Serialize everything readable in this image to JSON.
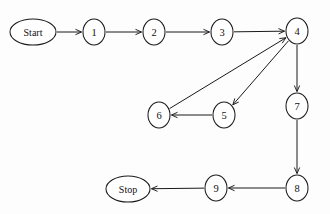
{
  "diagram": {
    "type": "flowchart",
    "title": "",
    "background_color": "#fdfdfd",
    "stroke_color": "#1a1a1a",
    "node_fill": "#ffffff",
    "arrow_style": "open-v",
    "nodes": [
      {
        "id": "start",
        "label": "Start",
        "shape": "ellipse",
        "x": 33,
        "y": 32,
        "rx": 23,
        "ry": 13
      },
      {
        "id": "n1",
        "label": "1",
        "shape": "ellipse",
        "x": 94,
        "y": 32,
        "rx": 11,
        "ry": 13
      },
      {
        "id": "n2",
        "label": "2",
        "shape": "ellipse",
        "x": 154,
        "y": 32,
        "rx": 11,
        "ry": 13
      },
      {
        "id": "n3",
        "label": "3",
        "shape": "ellipse",
        "x": 222,
        "y": 32,
        "rx": 11,
        "ry": 13
      },
      {
        "id": "n4",
        "label": "4",
        "shape": "ellipse",
        "x": 297,
        "y": 31,
        "rx": 11,
        "ry": 13
      },
      {
        "id": "n5",
        "label": "5",
        "shape": "ellipse",
        "x": 224,
        "y": 115,
        "rx": 11,
        "ry": 13
      },
      {
        "id": "n6",
        "label": "6",
        "shape": "ellipse",
        "x": 159,
        "y": 115,
        "rx": 11,
        "ry": 13
      },
      {
        "id": "n7",
        "label": "7",
        "shape": "ellipse",
        "x": 297,
        "y": 106,
        "rx": 11,
        "ry": 13
      },
      {
        "id": "n8",
        "label": "8",
        "shape": "ellipse",
        "x": 297,
        "y": 188,
        "rx": 11,
        "ry": 13
      },
      {
        "id": "n9",
        "label": "9",
        "shape": "ellipse",
        "x": 216,
        "y": 188,
        "rx": 11,
        "ry": 13
      },
      {
        "id": "stop",
        "label": "Stop",
        "shape": "ellipse",
        "x": 128,
        "y": 189,
        "rx": 22,
        "ry": 13
      }
    ],
    "edges": [
      {
        "id": "e-start-1",
        "from": "start",
        "to": "n1",
        "label": "",
        "directed": true
      },
      {
        "id": "e-1-2",
        "from": "n1",
        "to": "n2",
        "label": "",
        "directed": true
      },
      {
        "id": "e-2-3",
        "from": "n2",
        "to": "n3",
        "label": "",
        "directed": true
      },
      {
        "id": "e-3-4",
        "from": "n3",
        "to": "n4",
        "label": "",
        "directed": true
      },
      {
        "id": "e-4-5",
        "from": "n4",
        "to": "n5",
        "label": "",
        "directed": true
      },
      {
        "id": "e-5-6",
        "from": "n5",
        "to": "n6",
        "label": "",
        "directed": true
      },
      {
        "id": "e-6-4",
        "from": "n6",
        "to": "n4",
        "label": "",
        "directed": true
      },
      {
        "id": "e-4-7",
        "from": "n4",
        "to": "n7",
        "label": "",
        "directed": true
      },
      {
        "id": "e-7-8",
        "from": "n7",
        "to": "n8",
        "label": "",
        "directed": true
      },
      {
        "id": "e-8-9",
        "from": "n8",
        "to": "n9",
        "label": "",
        "directed": true
      },
      {
        "id": "e-9-stop",
        "from": "n9",
        "to": "stop",
        "label": "",
        "directed": true
      }
    ]
  }
}
